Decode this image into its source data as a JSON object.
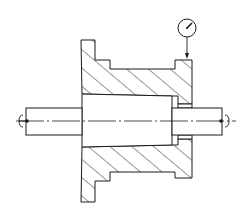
{
  "figure": {
    "type": "engineering-section-drawing",
    "colors": {
      "line": "#1a1a1a",
      "background": "#ffffff"
    },
    "parts": [
      {
        "name": "flanged-housing",
        "label": ""
      },
      {
        "name": "tapered-arbor",
        "label": ""
      },
      {
        "name": "dial-indicator",
        "label": ""
      },
      {
        "name": "left-center",
        "label": ""
      },
      {
        "name": "right-center",
        "label": ""
      }
    ]
  }
}
